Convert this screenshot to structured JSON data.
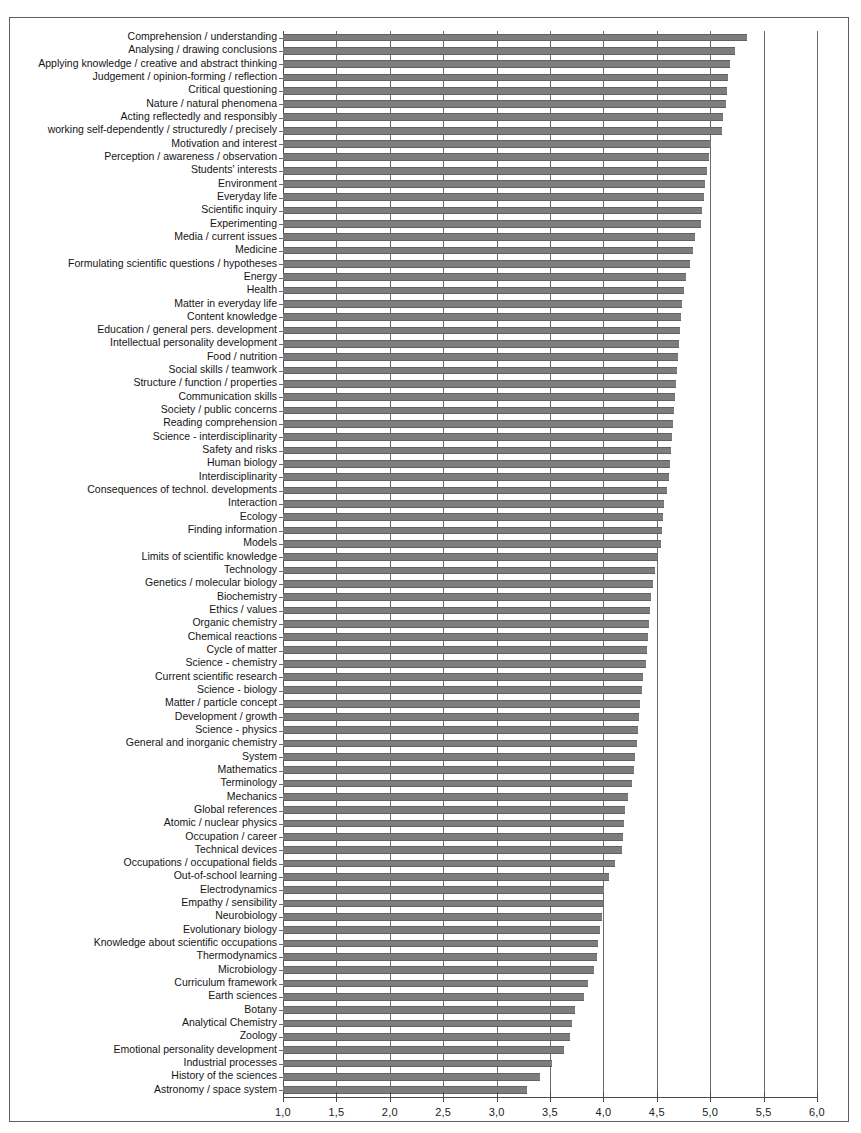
{
  "chart_data": {
    "type": "bar",
    "orientation": "horizontal",
    "title": "",
    "xlabel": "",
    "ylabel": "",
    "xlim": [
      1.0,
      6.0
    ],
    "grid": true,
    "legend": null,
    "decimal_separator": ",",
    "xticks": [
      "1,0",
      "1,5",
      "2,0",
      "2,5",
      "3,0",
      "3,5",
      "4,0",
      "4,5",
      "5,0",
      "5,5",
      "6,0"
    ],
    "xtick_values": [
      1.0,
      1.5,
      2.0,
      2.5,
      3.0,
      3.5,
      4.0,
      4.5,
      5.0,
      5.5,
      6.0
    ],
    "bar_color": "#7d7d7d",
    "categories": [
      "Comprehension / understanding",
      "Analysing / drawing conclusions",
      "Applying knowledge / creative and abstract thinking",
      "Judgement / opinion-forming / reflection",
      "Critical questioning",
      "Nature / natural phenomena",
      "Acting reflectedly and responsibly",
      "working self-dependently / structuredly / precisely",
      "Motivation and interest",
      "Perception / awareness / observation",
      "Students' interests",
      "Environment",
      "Everyday life",
      "Scientific inquiry",
      "Experimenting",
      "Media / current issues",
      "Medicine",
      "Formulating scientific questions / hypotheses",
      "Energy",
      "Health",
      "Matter in everyday life",
      "Content knowledge",
      "Education / general pers. development",
      "Intellectual personality development",
      "Food / nutrition",
      "Social skills / teamwork",
      "Structure / function / properties",
      "Communication skills",
      "Society / public concerns",
      "Reading comprehension",
      "Science - interdisciplinarity",
      "Safety and risks",
      "Human biology",
      "Interdisciplinarity",
      "Consequences of technol. developments",
      "Interaction",
      "Ecology",
      "Finding information",
      "Models",
      "Limits of scientific knowledge",
      "Technology",
      "Genetics / molecular biology",
      "Biochemistry",
      "Ethics / values",
      "Organic chemistry",
      "Chemical reactions",
      "Cycle of matter",
      "Science - chemistry",
      "Current scientific research",
      "Science - biology",
      "Matter / particle concept",
      "Development / growth",
      "Science - physics",
      "General and inorganic chemistry",
      "System",
      "Mathematics",
      "Terminology",
      "Mechanics",
      "Global references",
      "Atomic / nuclear physics",
      "Occupation / career",
      "Technical devices",
      "Occupations / occupational fields",
      "Out-of-school learning",
      "Electrodynamics",
      "Empathy / sensibility",
      "Neurobiology",
      "Evolutionary biology",
      "Knowledge about scientific occupations",
      "Thermodynamics",
      "Microbiology",
      "Curriculum framework",
      "Earth sciences",
      "Botany",
      "Analytical Chemistry",
      "Zoology",
      "Emotional personality development",
      "Industrial processes",
      "History of the sciences",
      "Astronomy / space system"
    ],
    "values": [
      5.34,
      5.23,
      5.19,
      5.17,
      5.16,
      5.15,
      5.12,
      5.11,
      5.01,
      4.99,
      4.97,
      4.95,
      4.94,
      4.92,
      4.91,
      4.86,
      4.84,
      4.81,
      4.77,
      4.75,
      4.74,
      4.73,
      4.72,
      4.71,
      4.7,
      4.69,
      4.68,
      4.67,
      4.66,
      4.65,
      4.64,
      4.63,
      4.62,
      4.61,
      4.6,
      4.57,
      4.56,
      4.55,
      4.54,
      4.5,
      4.48,
      4.46,
      4.45,
      4.44,
      4.43,
      4.42,
      4.41,
      4.4,
      4.37,
      4.36,
      4.34,
      4.33,
      4.32,
      4.31,
      4.3,
      4.29,
      4.27,
      4.23,
      4.2,
      4.19,
      4.18,
      4.17,
      4.11,
      4.05,
      4.01,
      4.0,
      3.99,
      3.97,
      3.95,
      3.94,
      3.91,
      3.86,
      3.82,
      3.73,
      3.71,
      3.69,
      3.63,
      3.52,
      3.41,
      3.28
    ]
  }
}
